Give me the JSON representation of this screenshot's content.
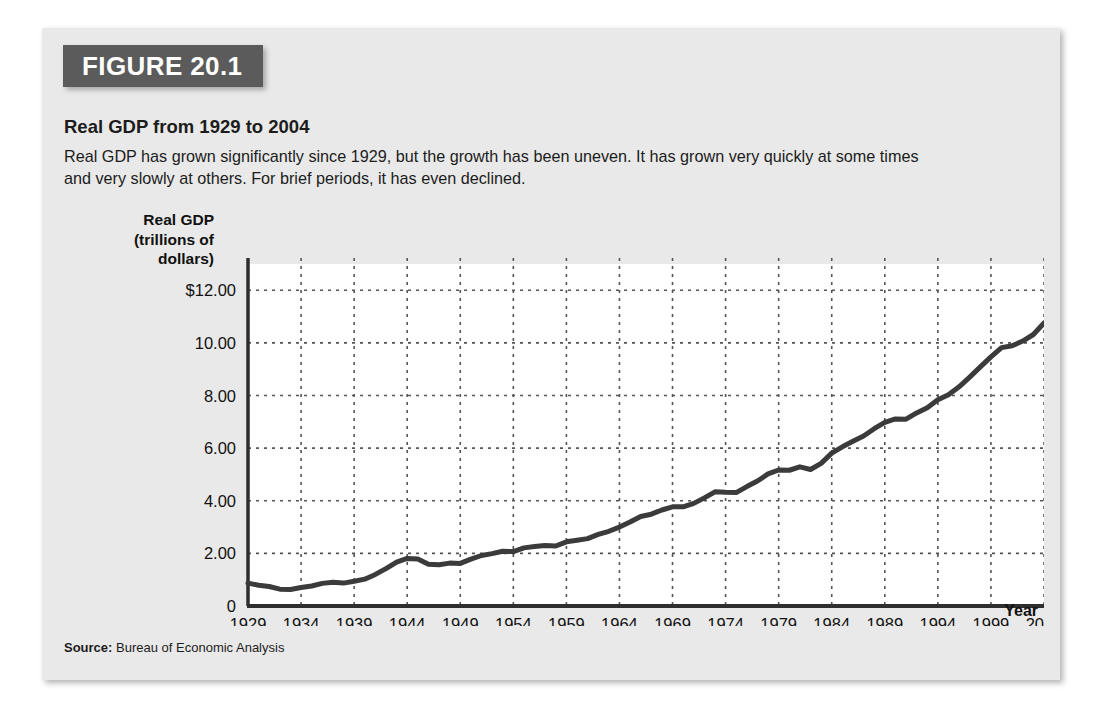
{
  "figure": {
    "number_label": "FIGURE 20.1",
    "title": "Real GDP from 1929 to 2004",
    "description": "Real GDP has grown significantly since 1929, but the growth has been uneven. It has grown very quickly at some times and very slowly at others. For brief periods, it has even declined.",
    "source_label": "Source:",
    "source_text": "Bureau of Economic Analysis",
    "banner_color": "#5b5b5b",
    "card_color": "#e9e9e9",
    "line_color": "#3b3b3b"
  },
  "chart_data": {
    "type": "line",
    "title": "Real GDP from 1929 to 2004",
    "xlabel": "Year",
    "ylabel": "Real GDP\n(trillions of\ndollars)",
    "ylabel_lines": [
      "Real GDP",
      "(trillions of",
      "dollars)"
    ],
    "xlim": [
      1929,
      2004
    ],
    "ylim": [
      0,
      13
    ],
    "grid": true,
    "legend": "none",
    "ytick_labels": [
      "$12.00",
      "10.00",
      "8.00",
      "6.00",
      "4.00",
      "2.00",
      "0"
    ],
    "ytick_values": [
      12,
      10,
      8,
      6,
      4,
      2,
      0
    ],
    "xtick_labels": [
      "1929",
      "1934",
      "1939",
      "1944",
      "1949",
      "1954",
      "1959",
      "1964",
      "1969",
      "1974",
      "1979",
      "1984",
      "1989",
      "1994",
      "1999",
      "2004"
    ],
    "xtick_values": [
      1929,
      1934,
      1939,
      1944,
      1949,
      1954,
      1959,
      1964,
      1969,
      1974,
      1979,
      1984,
      1989,
      1994,
      1999,
      2004
    ],
    "series": [
      {
        "name": "Real GDP (trillions of dollars)",
        "x": [
          1929,
          1930,
          1931,
          1932,
          1933,
          1934,
          1935,
          1936,
          1937,
          1938,
          1939,
          1940,
          1941,
          1942,
          1943,
          1944,
          1945,
          1946,
          1947,
          1948,
          1949,
          1950,
          1951,
          1952,
          1953,
          1954,
          1955,
          1956,
          1957,
          1958,
          1959,
          1960,
          1961,
          1962,
          1963,
          1964,
          1965,
          1966,
          1967,
          1968,
          1969,
          1970,
          1971,
          1972,
          1973,
          1974,
          1975,
          1976,
          1977,
          1978,
          1979,
          1980,
          1981,
          1982,
          1983,
          1984,
          1985,
          1986,
          1987,
          1988,
          1989,
          1990,
          1991,
          1992,
          1993,
          1994,
          1995,
          1996,
          1997,
          1998,
          1999,
          2000,
          2001,
          2002,
          2003,
          2004
        ],
        "values": [
          0.87,
          0.79,
          0.74,
          0.64,
          0.63,
          0.7,
          0.76,
          0.86,
          0.9,
          0.87,
          0.94,
          1.02,
          1.2,
          1.42,
          1.67,
          1.81,
          1.79,
          1.59,
          1.57,
          1.63,
          1.62,
          1.78,
          1.92,
          1.99,
          2.08,
          2.07,
          2.21,
          2.26,
          2.3,
          2.28,
          2.44,
          2.5,
          2.56,
          2.72,
          2.84,
          3.0,
          3.19,
          3.4,
          3.49,
          3.65,
          3.77,
          3.77,
          3.9,
          4.11,
          4.34,
          4.32,
          4.31,
          4.54,
          4.75,
          5.02,
          5.17,
          5.16,
          5.29,
          5.19,
          5.42,
          5.81,
          6.05,
          6.26,
          6.46,
          6.74,
          6.98,
          7.11,
          7.1,
          7.34,
          7.54,
          7.84,
          8.03,
          8.33,
          8.7,
          9.09,
          9.47,
          9.82,
          9.89,
          10.07,
          10.32,
          10.76
        ]
      }
    ],
    "annotations": []
  }
}
